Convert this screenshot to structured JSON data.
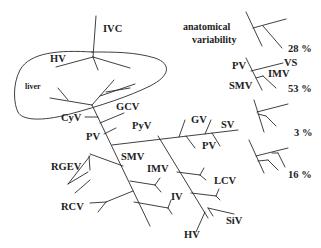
{
  "diagram": {
    "organ_label": "liver",
    "vessels": {
      "ivc": "IVC",
      "hv_top": "HV",
      "gcv": "GCV",
      "cyv": "CyV",
      "pv": "PV",
      "pyv": "PyV",
      "gv": "GV",
      "sv": "SV",
      "pv_branch": "PV",
      "rgev": "RGEV",
      "smv": "SMV",
      "imv": "IMV",
      "lcv": "LCV",
      "iv": "IV",
      "rcv": "RCV",
      "siv": "SiV",
      "hv_bottom": "HV"
    },
    "variability": {
      "title_line1": "anatomical",
      "title_line2": "variability",
      "variants": [
        {
          "percent": "28 %"
        },
        {
          "percent": "53 %",
          "labels": {
            "pv": "PV",
            "vs": "VS",
            "imv": "IMV",
            "smv": "SMV"
          }
        },
        {
          "percent": "3 %"
        },
        {
          "percent": "16 %"
        }
      ]
    }
  }
}
